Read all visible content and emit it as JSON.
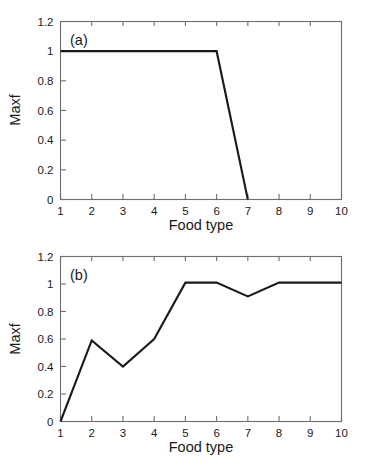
{
  "figure": {
    "background": "#ffffff",
    "line_color": "#1a1a1a",
    "axis_color": "#6e6e6e"
  },
  "chart_data": [
    {
      "type": "line",
      "panel_tag": "(a)",
      "title": "",
      "xlabel": "Food type",
      "ylabel": "Maxf",
      "xlim": [
        1,
        10
      ],
      "ylim": [
        0,
        1.2
      ],
      "xticks": [
        1,
        2,
        3,
        4,
        5,
        6,
        7,
        8,
        9,
        10
      ],
      "xticklabels": [
        "1",
        "2",
        "3",
        "4",
        "5",
        "6",
        "7",
        "8",
        "9",
        "10"
      ],
      "yticks": [
        0,
        0.2,
        0.4,
        0.6,
        0.8,
        1,
        1.2
      ],
      "yticklabels": [
        "0",
        "0.2",
        "0.4",
        "0.6",
        "0.8",
        "1",
        "1.2"
      ],
      "grid": false,
      "legend": null,
      "x": [
        1,
        2,
        3,
        4,
        5,
        6,
        7
      ],
      "values": [
        1.0,
        1.0,
        1.0,
        1.0,
        1.0,
        1.0,
        0.0
      ]
    },
    {
      "type": "line",
      "panel_tag": "(b)",
      "title": "",
      "xlabel": "Food type",
      "ylabel": "Maxf",
      "xlim": [
        1,
        10
      ],
      "ylim": [
        0,
        1.2
      ],
      "xticks": [
        1,
        2,
        3,
        4,
        5,
        6,
        7,
        8,
        9,
        10
      ],
      "xticklabels": [
        "1",
        "2",
        "3",
        "4",
        "5",
        "6",
        "7",
        "8",
        "9",
        "10"
      ],
      "yticks": [
        0,
        0.2,
        0.4,
        0.6,
        0.8,
        1,
        1.2
      ],
      "yticklabels": [
        "0",
        "0.2",
        "0.4",
        "0.6",
        "0.8",
        "1",
        "1.2"
      ],
      "grid": false,
      "legend": null,
      "x": [
        1,
        2,
        3,
        4,
        5,
        6,
        7,
        8,
        9,
        10
      ],
      "values": [
        0.0,
        0.59,
        0.4,
        0.6,
        1.01,
        1.01,
        0.91,
        1.01,
        1.01,
        1.01
      ]
    }
  ]
}
